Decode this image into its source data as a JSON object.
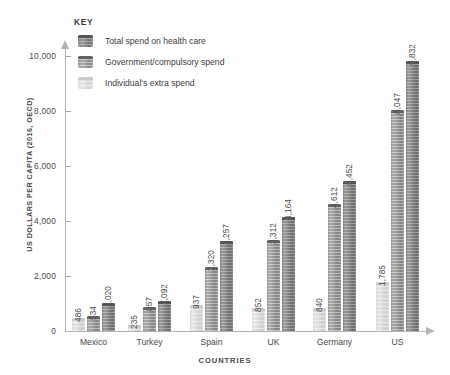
{
  "chart_data": {
    "type": "bar",
    "title": "",
    "xlabel": "COUNTRIES",
    "ylabel": "US DOLLARS PER CAPITA (2016, OECD)",
    "ylim": [
      0,
      10000
    ],
    "yticks": [
      "0",
      "2,000",
      "4,000",
      "6,000",
      "8,000",
      "10,000"
    ],
    "ytick_values": [
      0,
      2000,
      4000,
      6000,
      8000,
      10000
    ],
    "grid": false,
    "legend_position": "top-left",
    "categories": [
      "Mexico",
      "Turkey",
      "Spain",
      "UK",
      "Germany",
      "US"
    ],
    "series": [
      {
        "name": "Individual's extra spend",
        "style": "light",
        "values": [
          486,
          235,
          937,
          852,
          840,
          1785
        ],
        "labels": [
          "486",
          "235",
          "937",
          "852",
          "840",
          "1,785"
        ]
      },
      {
        "name": "Government/compulsory spend",
        "style": "mid",
        "values": [
          534,
          857,
          2320,
          3312,
          4612,
          8047
        ],
        "labels": [
          "534",
          "857",
          "2,320",
          "3,312",
          "4,612",
          "8,047"
        ]
      },
      {
        "name": "Total spend on health care",
        "style": "dark",
        "values": [
          1020,
          1092,
          3257,
          4164,
          5452,
          9832
        ],
        "labels": [
          "1,020",
          "1,092",
          "3,257",
          "4,164",
          "5,452",
          "9,832"
        ]
      }
    ]
  },
  "legend": {
    "title": "KEY",
    "items": [
      {
        "label": "Total spend on health care",
        "style": "dark"
      },
      {
        "label": "Government/compulsory spend",
        "style": "mid"
      },
      {
        "label": "Individual's extra spend",
        "style": "light"
      }
    ]
  },
  "colors": {
    "dark": "#868686",
    "mid": "#9b9b9b",
    "light": "#dcdcdc",
    "axis": "#b4b4b4",
    "text": "#4a4a4a",
    "background": "#ffffff"
  }
}
